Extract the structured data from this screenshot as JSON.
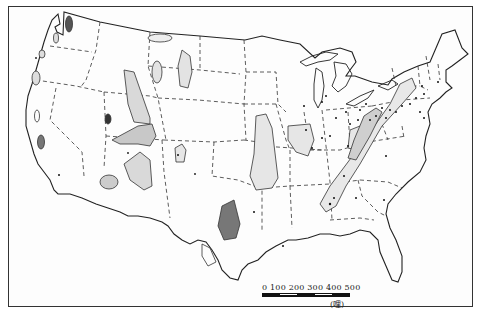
{
  "figure": {
    "type": "map",
    "frame": true
  },
  "scale_bar": {
    "ticks": [
      "0",
      "100",
      "200",
      "300",
      "400",
      "500"
    ],
    "unit": "(哩)"
  },
  "colors": {
    "coast_line": "#222222",
    "state_border": "#333333",
    "region_fill": "#d9d9d9",
    "region_dark": "#555555",
    "point": "#111111",
    "background": "#ffffff"
  }
}
